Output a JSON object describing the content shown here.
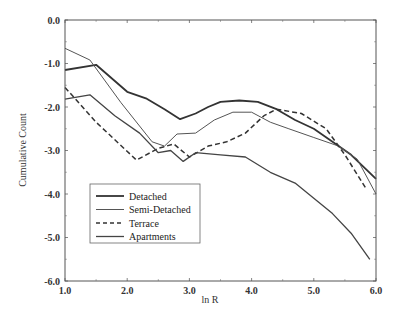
{
  "chart_data": {
    "type": "line",
    "title": "",
    "xlabel": "ln R",
    "ylabel": "Cumulative Count",
    "xlim": [
      1.0,
      6.0
    ],
    "ylim": [
      -6.0,
      0.0
    ],
    "xticks": [
      "1.0",
      "2.0",
      "3.0",
      "4.0",
      "5.0",
      "6.0"
    ],
    "yticks": [
      "0.0",
      "-1.0",
      "-2.0",
      "-3.0",
      "-4.0",
      "-5.0",
      "-6.0"
    ],
    "grid": false,
    "legend_position": "lower-left inside",
    "series": [
      {
        "name": "Detached",
        "style": "solid-thick",
        "color": "#333333",
        "points": [
          [
            1.0,
            -1.15
          ],
          [
            1.5,
            -1.03
          ],
          [
            2.0,
            -1.65
          ],
          [
            2.3,
            -1.8
          ],
          [
            2.6,
            -2.05
          ],
          [
            2.85,
            -2.28
          ],
          [
            3.1,
            -2.15
          ],
          [
            3.3,
            -2.0
          ],
          [
            3.5,
            -1.88
          ],
          [
            3.8,
            -1.85
          ],
          [
            4.1,
            -1.88
          ],
          [
            4.4,
            -2.05
          ],
          [
            4.7,
            -2.3
          ],
          [
            5.0,
            -2.5
          ],
          [
            5.3,
            -2.8
          ],
          [
            5.6,
            -3.1
          ],
          [
            6.0,
            -3.65
          ]
        ]
      },
      {
        "name": "Semi-Detached",
        "style": "solid-thin",
        "color": "#555555",
        "points": [
          [
            1.0,
            -0.65
          ],
          [
            1.4,
            -0.92
          ],
          [
            1.9,
            -1.9
          ],
          [
            2.4,
            -2.8
          ],
          [
            2.6,
            -2.9
          ],
          [
            2.8,
            -2.62
          ],
          [
            3.1,
            -2.6
          ],
          [
            3.4,
            -2.3
          ],
          [
            3.7,
            -2.12
          ],
          [
            4.0,
            -2.12
          ],
          [
            4.3,
            -2.35
          ],
          [
            4.6,
            -2.5
          ],
          [
            5.0,
            -2.7
          ],
          [
            5.4,
            -2.9
          ],
          [
            5.7,
            -3.2
          ],
          [
            6.0,
            -4.0
          ]
        ]
      },
      {
        "name": "Terrace",
        "style": "dashed",
        "color": "#333333",
        "points": [
          [
            1.0,
            -1.55
          ],
          [
            1.5,
            -2.35
          ],
          [
            2.15,
            -3.22
          ],
          [
            2.5,
            -2.95
          ],
          [
            2.75,
            -2.85
          ],
          [
            3.0,
            -3.15
          ],
          [
            3.3,
            -2.9
          ],
          [
            3.6,
            -2.8
          ],
          [
            3.9,
            -2.6
          ],
          [
            4.2,
            -2.2
          ],
          [
            4.4,
            -2.05
          ],
          [
            4.8,
            -2.15
          ],
          [
            5.2,
            -2.5
          ],
          [
            5.5,
            -3.1
          ],
          [
            5.85,
            -3.9
          ]
        ]
      },
      {
        "name": "Apartments",
        "style": "solid",
        "color": "#444444",
        "points": [
          [
            1.0,
            -1.82
          ],
          [
            1.4,
            -1.72
          ],
          [
            1.8,
            -2.2
          ],
          [
            2.2,
            -2.6
          ],
          [
            2.5,
            -3.05
          ],
          [
            2.7,
            -3.0
          ],
          [
            2.9,
            -3.25
          ],
          [
            3.1,
            -3.05
          ],
          [
            3.5,
            -3.1
          ],
          [
            3.9,
            -3.15
          ],
          [
            4.3,
            -3.5
          ],
          [
            4.7,
            -3.75
          ],
          [
            5.0,
            -4.1
          ],
          [
            5.3,
            -4.45
          ],
          [
            5.6,
            -4.9
          ],
          [
            5.9,
            -5.5
          ]
        ]
      }
    ]
  },
  "legend": {
    "items": [
      "Detached",
      "Semi-Detached",
      "Terrace",
      "Apartments"
    ]
  },
  "axes": {
    "xlabel": "ln R",
    "ylabel": "Cumulative Count"
  }
}
